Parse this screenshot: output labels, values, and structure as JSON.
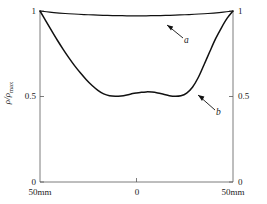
{
  "chart_data": {
    "type": "line",
    "title": "",
    "xlabel": "",
    "ylabel": "ρ/ρ",
    "ylabel_sub": "max",
    "xlim": [
      -50,
      50
    ],
    "ylim": [
      0,
      1.05
    ],
    "grid": false,
    "legend_position": "inline-annotation",
    "x_tick_labels": [
      "50mm",
      "0",
      "50mm"
    ],
    "x_tick_values": [
      -50,
      0,
      50
    ],
    "y_tick_labels": [
      "0",
      "0.5",
      "1"
    ],
    "y_tick_values": [
      0,
      0.5,
      1
    ],
    "y_axis_right_labels": [
      "0",
      "0.5",
      "1"
    ],
    "series": [
      {
        "name": "a",
        "label": "a",
        "color": "#111111",
        "x": [
          -50,
          -45,
          -40,
          -35,
          -30,
          -25,
          -20,
          -15,
          -10,
          -5,
          0,
          5,
          10,
          15,
          20,
          25,
          30,
          35,
          40,
          45,
          50
        ],
        "values": [
          1.0,
          0.993,
          0.988,
          0.984,
          0.981,
          0.978,
          0.976,
          0.974,
          0.973,
          0.972,
          0.972,
          0.972,
          0.973,
          0.974,
          0.976,
          0.978,
          0.981,
          0.984,
          0.988,
          0.993,
          1.0
        ]
      },
      {
        "name": "b",
        "label": "b",
        "color": "#111111",
        "x": [
          -50,
          -47,
          -44,
          -41,
          -38,
          -35,
          -32,
          -29,
          -26,
          -23,
          -20,
          -17,
          -14,
          -11,
          -8,
          -5,
          -2,
          0,
          2,
          5,
          8,
          11,
          14,
          17,
          20,
          23,
          26,
          29,
          32,
          35,
          38,
          41,
          44,
          47,
          50
        ],
        "values": [
          1.0,
          0.942,
          0.885,
          0.829,
          0.776,
          0.726,
          0.679,
          0.637,
          0.598,
          0.564,
          0.536,
          0.515,
          0.504,
          0.501,
          0.503,
          0.509,
          0.517,
          0.521,
          0.524,
          0.527,
          0.526,
          0.521,
          0.513,
          0.505,
          0.501,
          0.504,
          0.52,
          0.554,
          0.611,
          0.686,
          0.763,
          0.838,
          0.902,
          0.958,
          1.0
        ]
      }
    ],
    "annotations": [
      {
        "text": "a",
        "target_series": "a",
        "arrow": "points-up-left"
      },
      {
        "text": "b",
        "target_series": "b",
        "arrow": "points-up-left"
      }
    ]
  },
  "axes": {
    "left_ticks": [
      "1",
      "0.5",
      "0"
    ],
    "right_ticks": [
      "1",
      "0.5",
      "0"
    ],
    "bottom_ticks": [
      "50mm",
      "0",
      "50mm"
    ]
  },
  "colors": {
    "curve": "#111111",
    "axis": "#5a5a5a",
    "text": "#1a1a1a",
    "background": "#ffffff"
  }
}
